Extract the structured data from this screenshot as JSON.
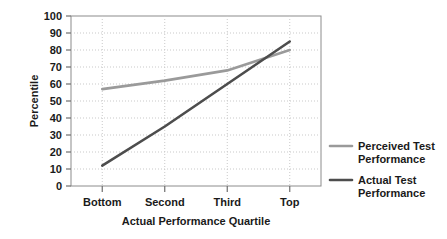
{
  "chart_data": {
    "type": "line",
    "title": "",
    "subtitle": "",
    "xlabel": "Actual Performance Quartile",
    "ylabel": "Percentile",
    "categories": [
      "Bottom",
      "Second",
      "Third",
      "Top"
    ],
    "ylim": [
      0,
      100
    ],
    "yticks": [
      0,
      10,
      20,
      30,
      40,
      50,
      60,
      70,
      80,
      90,
      100
    ],
    "ytick_labels": [
      "0",
      "10",
      "20",
      "30",
      "40",
      "50",
      "60",
      "70",
      "80",
      "90",
      "100"
    ],
    "grid": true,
    "grid_style": "dotted-horizontal-and-vertical",
    "legend_position": "right",
    "series": [
      {
        "name": "Perceived Test Performance",
        "values": [
          57,
          62,
          68,
          80
        ],
        "color": "#9a9a9a"
      },
      {
        "name": "Actual Test Performance",
        "values": [
          12,
          35,
          60,
          85
        ],
        "color": "#4d4d4d"
      }
    ],
    "annotations": []
  },
  "legend": {
    "items": [
      {
        "label_line1": "Perceived Test",
        "label_line2": "Performance",
        "color": "#9a9a9a"
      },
      {
        "label_line1": "Actual Test",
        "label_line2": "Performance",
        "color": "#4d4d4d"
      }
    ]
  },
  "colors": {
    "background": "#ffffff",
    "frame": "#8c8c8c",
    "grid": "#c9c9c9",
    "text": "#1a1a1a",
    "perceived": "#9a9a9a",
    "actual": "#4d4d4d"
  }
}
